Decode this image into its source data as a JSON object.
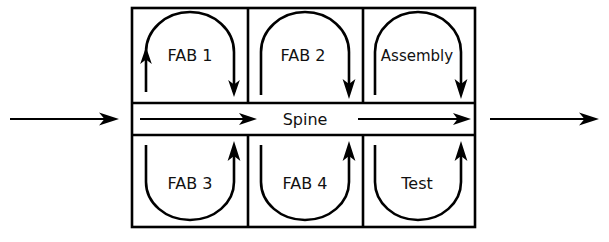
{
  "diagram": {
    "style": {
      "background": "#ffffff",
      "line_color": "#000000",
      "text_color": "#111111"
    },
    "outer_box": {
      "x": 132,
      "y": 8,
      "width": 343,
      "height": 219
    },
    "spine": {
      "label": "Spine",
      "band": {
        "y": 103,
        "height": 32
      },
      "inner_arrows": [
        {
          "name": "spine-arrow-left",
          "x1": 140,
          "x2": 255,
          "y": 119,
          "direction": "right"
        },
        {
          "name": "spine-arrow-right",
          "x1": 358,
          "x2": 470,
          "y": 119,
          "direction": "right"
        }
      ]
    },
    "entry_arrow": {
      "name": "input-arrow",
      "x1": 10,
      "x2": 118,
      "y": 119,
      "direction": "right"
    },
    "exit_arrow": {
      "name": "output-arrow",
      "x1": 490,
      "x2": 598,
      "y": 119,
      "direction": "right"
    },
    "columns": [
      {
        "x": 132,
        "width": 116
      },
      {
        "x": 248,
        "width": 115
      },
      {
        "x": 363,
        "width": 112
      }
    ],
    "cells": [
      {
        "id": "fab-1",
        "label": "FAB 1",
        "row": "top",
        "column": 0,
        "loop_shape": "inverted-u",
        "arrowheads": [
          "left-up",
          "right-down"
        ]
      },
      {
        "id": "fab-2",
        "label": "FAB 2",
        "row": "top",
        "column": 1,
        "loop_shape": "inverted-u",
        "arrowheads": [
          "right-down"
        ]
      },
      {
        "id": "assembly",
        "label": "Assembly",
        "row": "top",
        "column": 2,
        "loop_shape": "inverted-u",
        "arrowheads": [
          "right-down"
        ]
      },
      {
        "id": "fab-3",
        "label": "FAB 3",
        "row": "bottom",
        "column": 0,
        "loop_shape": "u",
        "arrowheads": [
          "right-up"
        ]
      },
      {
        "id": "fab-4",
        "label": "FAB 4",
        "row": "bottom",
        "column": 1,
        "loop_shape": "u",
        "arrowheads": [
          "right-up"
        ]
      },
      {
        "id": "test",
        "label": "Test",
        "row": "bottom",
        "column": 2,
        "loop_shape": "u",
        "arrowheads": [
          "right-up"
        ]
      }
    ]
  }
}
